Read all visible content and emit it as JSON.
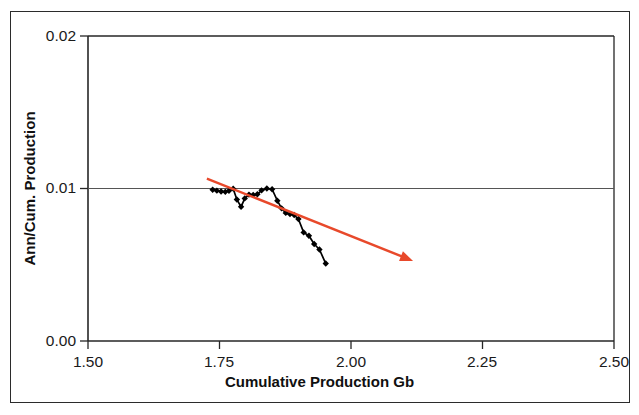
{
  "chart_data": {
    "type": "line",
    "title": "",
    "xlabel": "Cumulative Production Gb",
    "ylabel": "Ann/Cum. Production",
    "xlim": [
      1.5,
      2.5
    ],
    "ylim": [
      0.0,
      0.02
    ],
    "xticks": [
      "1.50",
      "1.75",
      "2.00",
      "2.25",
      "2.50"
    ],
    "xtick_values": [
      1.5,
      1.75,
      2.0,
      2.25,
      2.5
    ],
    "yticks": [
      "0.00",
      "0.01",
      "0.02"
    ],
    "ytick_values": [
      0.0,
      0.01,
      0.02
    ],
    "grid": "horizontal-gridline-at-0.01",
    "legend": "none",
    "series": [
      {
        "name": "Ann/Cum. Production vs Cumulative Production",
        "marker": "diamond",
        "color": "#000000",
        "x": [
          1.737,
          1.745,
          1.753,
          1.761,
          1.768,
          1.776,
          1.783,
          1.791,
          1.798,
          1.806,
          1.814,
          1.822,
          1.83,
          1.84,
          1.85,
          1.86,
          1.868,
          1.876,
          1.884,
          1.892,
          1.9,
          1.91,
          1.92,
          1.93,
          1.94,
          1.952
        ],
        "y": [
          0.00992,
          0.00986,
          0.0098,
          0.00978,
          0.00985,
          0.00999,
          0.00928,
          0.0088,
          0.00935,
          0.0096,
          0.00958,
          0.00962,
          0.00988,
          0.01,
          0.00995,
          0.0092,
          0.0087,
          0.0084,
          0.00832,
          0.00826,
          0.008,
          0.00712,
          0.0069,
          0.00636,
          0.006,
          0.00508
        ]
      }
    ],
    "annotations": [
      {
        "type": "arrow",
        "name": "decline-trend-arrow",
        "color": "#E8492B",
        "x_start": 1.726,
        "y_start": 0.01065,
        "x_end": 2.118,
        "y_end": 0.00525
      }
    ]
  }
}
